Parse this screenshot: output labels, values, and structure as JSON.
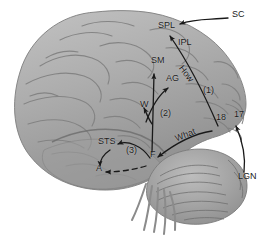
{
  "figure": {
    "type": "anatomical-diagram",
    "background_color": "#ffffff",
    "brain_fill": "#a8a8a8",
    "ink_color": "#191919"
  },
  "labels": [
    {
      "id": "spl",
      "text": "SPL",
      "x": 158,
      "y": 27,
      "size": "sm",
      "style": "plain",
      "desc": "superior parietal lobule"
    },
    {
      "id": "ipl",
      "text": "IPL",
      "x": 178,
      "y": 44,
      "size": "sm",
      "style": "plain",
      "desc": "inferior parietal lobule"
    },
    {
      "id": "sc",
      "text": "SC",
      "x": 232,
      "y": 16,
      "size": "sm",
      "style": "plain",
      "desc": "superior colliculus"
    },
    {
      "id": "sm",
      "text": "SM",
      "x": 151,
      "y": 62,
      "size": "sm",
      "style": "plain",
      "desc": "supramarginal gyrus"
    },
    {
      "id": "ag",
      "text": "AG",
      "x": 166,
      "y": 80,
      "size": "sm",
      "style": "plain",
      "desc": "angular gyrus"
    },
    {
      "id": "how",
      "text": "How",
      "x": 188,
      "y": 70,
      "size": "sm",
      "style": "plain",
      "desc": "dorsal stream label",
      "rotate": 52
    },
    {
      "id": "n1",
      "text": "(1)",
      "x": 203,
      "y": 92,
      "size": "sm",
      "style": "plain",
      "desc": "pathway one marker"
    },
    {
      "id": "w",
      "text": "W",
      "x": 140,
      "y": 106,
      "size": "sm",
      "style": "plain",
      "desc": "Wernicke area"
    },
    {
      "id": "n2",
      "text": "(2)",
      "x": 160,
      "y": 115,
      "size": "sm",
      "style": "plain",
      "desc": "pathway two marker"
    },
    {
      "id": "a18",
      "text": "18",
      "x": 216,
      "y": 119,
      "size": "sm",
      "style": "plain",
      "desc": "Brodmann area 18"
    },
    {
      "id": "a17",
      "text": "17",
      "x": 234,
      "y": 116,
      "size": "sm",
      "style": "plain",
      "desc": "Brodmann area 17"
    },
    {
      "id": "what",
      "text": "What",
      "x": 178,
      "y": 139,
      "size": "sm",
      "style": "plain",
      "desc": "ventral stream label",
      "rotate": -22
    },
    {
      "id": "sts",
      "text": "STS",
      "x": 100,
      "y": 143,
      "size": "sm",
      "style": "plain",
      "desc": "superior temporal sulcus"
    },
    {
      "id": "n3",
      "text": "(3)",
      "x": 126,
      "y": 152,
      "size": "sm",
      "style": "plain",
      "desc": "pathway three marker"
    },
    {
      "id": "f",
      "text": "F",
      "x": 150,
      "y": 156,
      "size": "sm",
      "style": "plain",
      "desc": "fusiform / form area"
    },
    {
      "id": "a",
      "text": "A",
      "x": 96,
      "y": 170,
      "size": "sm",
      "style": "plain",
      "desc": "anterior temporal"
    },
    {
      "id": "lgn",
      "text": "LGN",
      "x": 238,
      "y": 178,
      "size": "sm",
      "style": "plain",
      "desc": "lateral geniculate nucleus"
    }
  ],
  "connectors": [
    {
      "id": "sc-arrow",
      "from": "SC",
      "to": "SPL",
      "style": "solid",
      "desc": "leader arrow to superior parietal"
    },
    {
      "id": "lgn-arrow",
      "from": "LGN",
      "to": "17",
      "style": "solid",
      "desc": "leader arrow to occipital pole"
    },
    {
      "id": "dorsal",
      "from": "18",
      "to": "SPL",
      "style": "solid",
      "desc": "How / dorsal stream"
    },
    {
      "id": "ventral",
      "from": "18",
      "to": "F",
      "style": "solid",
      "desc": "What / ventral stream"
    },
    {
      "id": "f-sm",
      "from": "F",
      "to": "SM",
      "style": "solid",
      "desc": "vertical pathway (2)"
    },
    {
      "id": "f-ag",
      "from": "F",
      "to": "AG",
      "style": "solid",
      "desc": "diagonal pathway to angular gyrus"
    },
    {
      "id": "f-w",
      "from": "F",
      "to": "W",
      "style": "solid",
      "desc": "pathway to Wernicke area"
    },
    {
      "id": "f-sts",
      "from": "F",
      "to": "STS",
      "style": "solid",
      "desc": "pathway (3) to STS"
    },
    {
      "id": "f-a",
      "from": "F",
      "to": "A",
      "style": "dashed",
      "desc": "dashed anterior temporal pathway"
    },
    {
      "id": "a-sts",
      "from": "A",
      "to": "STS",
      "style": "solid",
      "desc": "curved arrow up to STS"
    }
  ]
}
